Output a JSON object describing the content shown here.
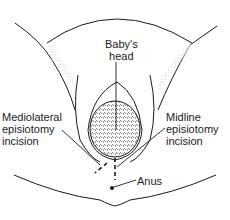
{
  "diagram": {
    "labels": {
      "babys_head": [
        "Baby's",
        "head"
      ],
      "mediolateral": [
        "Mediolateral",
        "episiotomy",
        "incision"
      ],
      "midline": [
        "Midline",
        "episiotomy",
        "incision"
      ],
      "anus": "Anus"
    },
    "colors": {
      "line": "#1a1a1a",
      "shade": "#bdbdbd",
      "background": "#ffffff"
    }
  }
}
